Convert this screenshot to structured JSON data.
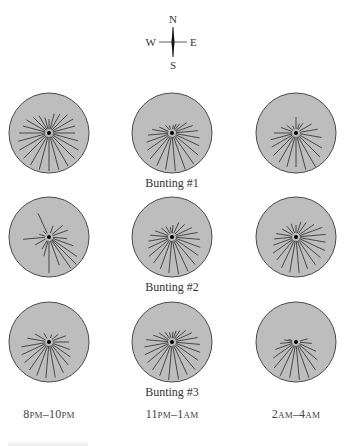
{
  "compass": {
    "north": "N",
    "south": "S",
    "east": "E",
    "west": "W",
    "center": [
      173,
      42
    ]
  },
  "colors": {
    "disc_fill": "#bdbdbd",
    "disc_stroke": "#4a4a4a",
    "ray": "#3a3a3a",
    "center_dot": "#000000"
  },
  "columns": [
    {
      "label_a": "8",
      "label_a_sc": "PM",
      "dash": "–",
      "label_b": "10",
      "label_b_sc": "PM",
      "x": 49
    },
    {
      "label_a": "11",
      "label_a_sc": "PM",
      "dash": "–",
      "label_b": "1",
      "label_b_sc": "AM",
      "x": 172
    },
    {
      "label_a": "2",
      "label_a_sc": "AM",
      "dash": "–",
      "label_b": "4",
      "label_b_sc": "AM",
      "x": 296
    }
  ],
  "rows": [
    {
      "label": "Bunting #1",
      "y": 133,
      "label_y": 176
    },
    {
      "label": "Bunting #2",
      "y": 237,
      "label_y": 280
    },
    {
      "label": "Bunting #3",
      "y": 342,
      "label_y": 385
    }
  ],
  "disc_radius": 40,
  "panels": [
    {
      "row": 0,
      "col": 0,
      "rays": [
        [
          0,
          14
        ],
        [
          15,
          20
        ],
        [
          30,
          22
        ],
        [
          45,
          26
        ],
        [
          60,
          28
        ],
        [
          75,
          27
        ],
        [
          90,
          26
        ],
        [
          105,
          30
        ],
        [
          120,
          34
        ],
        [
          135,
          36
        ],
        [
          150,
          38
        ],
        [
          165,
          38
        ],
        [
          180,
          38
        ],
        [
          195,
          38
        ],
        [
          210,
          37
        ],
        [
          225,
          36
        ],
        [
          240,
          34
        ],
        [
          255,
          32
        ],
        [
          270,
          30
        ],
        [
          285,
          27
        ],
        [
          300,
          26
        ],
        [
          315,
          22
        ],
        [
          330,
          20
        ],
        [
          345,
          16
        ]
      ]
    },
    {
      "row": 0,
      "col": 1,
      "rays": [
        [
          10,
          8
        ],
        [
          25,
          10
        ],
        [
          40,
          12
        ],
        [
          55,
          18
        ],
        [
          70,
          22
        ],
        [
          85,
          26
        ],
        [
          100,
          28
        ],
        [
          115,
          30
        ],
        [
          130,
          34
        ],
        [
          145,
          38
        ],
        [
          160,
          39
        ],
        [
          175,
          38
        ],
        [
          190,
          37
        ],
        [
          205,
          36
        ],
        [
          220,
          34
        ],
        [
          235,
          30
        ],
        [
          250,
          27
        ],
        [
          265,
          24
        ],
        [
          280,
          20
        ],
        [
          295,
          14
        ],
        [
          320,
          10
        ],
        [
          340,
          8
        ]
      ]
    },
    {
      "row": 0,
      "col": 2,
      "rays": [
        [
          0,
          16
        ],
        [
          20,
          10
        ],
        [
          35,
          12
        ],
        [
          60,
          18
        ],
        [
          80,
          22
        ],
        [
          100,
          26
        ],
        [
          120,
          30
        ],
        [
          135,
          34
        ],
        [
          150,
          40
        ],
        [
          165,
          38
        ],
        [
          180,
          34
        ],
        [
          195,
          35
        ],
        [
          210,
          34
        ],
        [
          225,
          32
        ],
        [
          240,
          28
        ],
        [
          255,
          26
        ],
        [
          270,
          22
        ],
        [
          290,
          16
        ],
        [
          310,
          12
        ],
        [
          335,
          8
        ]
      ]
    },
    {
      "row": 1,
      "col": 0,
      "rays": [
        [
          335,
          26
        ],
        [
          20,
          12
        ],
        [
          50,
          18
        ],
        [
          70,
          20
        ],
        [
          95,
          18
        ],
        [
          110,
          26
        ],
        [
          125,
          34
        ],
        [
          135,
          40
        ],
        [
          145,
          38
        ],
        [
          160,
          30
        ],
        [
          180,
          36
        ],
        [
          195,
          20
        ],
        [
          210,
          14
        ],
        [
          240,
          16
        ],
        [
          265,
          26
        ],
        [
          285,
          10
        ],
        [
          315,
          8
        ]
      ]
    },
    {
      "row": 1,
      "col": 1,
      "rays": [
        [
          5,
          12
        ],
        [
          25,
          16
        ],
        [
          45,
          18
        ],
        [
          65,
          22
        ],
        [
          80,
          26
        ],
        [
          95,
          28
        ],
        [
          110,
          30
        ],
        [
          125,
          32
        ],
        [
          140,
          36
        ],
        [
          155,
          38
        ],
        [
          170,
          38
        ],
        [
          185,
          36
        ],
        [
          200,
          34
        ],
        [
          215,
          32
        ],
        [
          230,
          30
        ],
        [
          245,
          26
        ],
        [
          260,
          24
        ],
        [
          275,
          22
        ],
        [
          290,
          18
        ],
        [
          310,
          14
        ],
        [
          330,
          12
        ],
        [
          350,
          10
        ]
      ]
    },
    {
      "row": 1,
      "col": 2,
      "rays": [
        [
          0,
          12
        ],
        [
          18,
          16
        ],
        [
          35,
          18
        ],
        [
          55,
          22
        ],
        [
          70,
          28
        ],
        [
          85,
          30
        ],
        [
          100,
          30
        ],
        [
          115,
          32
        ],
        [
          130,
          32
        ],
        [
          145,
          34
        ],
        [
          160,
          34
        ],
        [
          175,
          36
        ],
        [
          190,
          36
        ],
        [
          205,
          34
        ],
        [
          220,
          30
        ],
        [
          235,
          28
        ],
        [
          250,
          24
        ],
        [
          265,
          22
        ],
        [
          280,
          20
        ],
        [
          300,
          16
        ],
        [
          320,
          14
        ],
        [
          340,
          14
        ]
      ]
    },
    {
      "row": 2,
      "col": 0,
      "rays": [
        [
          20,
          8
        ],
        [
          50,
          12
        ],
        [
          70,
          18
        ],
        [
          90,
          20
        ],
        [
          110,
          22
        ],
        [
          125,
          26
        ],
        [
          140,
          30
        ],
        [
          155,
          34
        ],
        [
          170,
          36
        ],
        [
          185,
          36
        ],
        [
          200,
          36
        ],
        [
          215,
          34
        ],
        [
          230,
          32
        ],
        [
          245,
          30
        ],
        [
          260,
          28
        ],
        [
          280,
          22
        ],
        [
          300,
          16
        ],
        [
          330,
          10
        ]
      ]
    },
    {
      "row": 2,
      "col": 1,
      "rays": [
        [
          5,
          10
        ],
        [
          20,
          12
        ],
        [
          35,
          14
        ],
        [
          50,
          18
        ],
        [
          65,
          22
        ],
        [
          80,
          26
        ],
        [
          95,
          28
        ],
        [
          110,
          30
        ],
        [
          125,
          32
        ],
        [
          140,
          36
        ],
        [
          155,
          36
        ],
        [
          170,
          38
        ],
        [
          185,
          38
        ],
        [
          200,
          36
        ],
        [
          215,
          34
        ],
        [
          230,
          32
        ],
        [
          245,
          30
        ],
        [
          260,
          28
        ],
        [
          275,
          26
        ],
        [
          290,
          20
        ],
        [
          305,
          16
        ],
        [
          325,
          12
        ],
        [
          345,
          10
        ]
      ]
    },
    {
      "row": 2,
      "col": 2,
      "rays": [
        [
          75,
          12
        ],
        [
          95,
          16
        ],
        [
          115,
          22
        ],
        [
          130,
          28
        ],
        [
          145,
          34
        ],
        [
          160,
          38
        ],
        [
          175,
          38
        ],
        [
          190,
          36
        ],
        [
          205,
          38
        ],
        [
          220,
          34
        ],
        [
          235,
          28
        ],
        [
          250,
          22
        ],
        [
          265,
          16
        ],
        [
          280,
          12
        ],
        [
          290,
          8
        ]
      ]
    }
  ]
}
